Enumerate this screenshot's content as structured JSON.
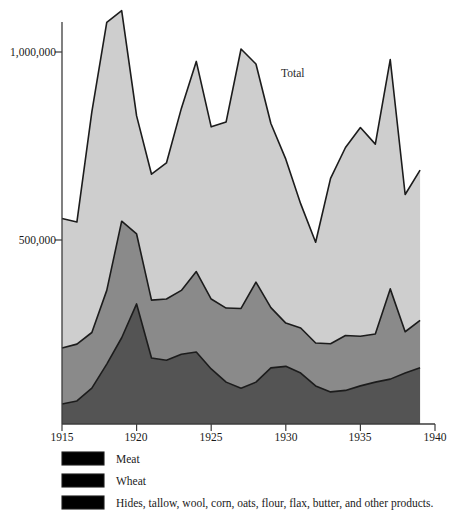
{
  "chart_data": {
    "type": "area",
    "title": "",
    "subtitle": "",
    "xlabel": "",
    "ylabel": "",
    "stacked": true,
    "grid": false,
    "legend_position": "bottom-left",
    "annotations": [
      {
        "text": "Total",
        "x": 1927.8,
        "y": 905000
      }
    ],
    "xlim": [
      1915,
      1940
    ],
    "ylim": [
      0,
      1150000
    ],
    "x_ticks": [
      1915,
      1920,
      1925,
      1930,
      1935,
      1940
    ],
    "x_tick_labels": [
      "1915",
      "1920",
      "1925",
      "1930",
      "1935",
      "1940"
    ],
    "y_ticks": [
      500000,
      1000000
    ],
    "y_tick_labels": [
      "500,000",
      "1,000,000"
    ],
    "x": [
      1915,
      1916,
      1917,
      1918,
      1919,
      1920,
      1921,
      1922,
      1923,
      1924,
      1925,
      1926,
      1927,
      1928,
      1929,
      1930,
      1931,
      1932,
      1933,
      1934,
      1935,
      1936,
      1937,
      1938,
      1939
    ],
    "series": [
      {
        "name": "Meat",
        "color": "#545454",
        "values": [
          64000,
          72000,
          106000,
          170000,
          240000,
          330000,
          186000,
          180000,
          196000,
          202000,
          157000,
          122000,
          106000,
          122000,
          160000,
          164000,
          146000,
          112000,
          96000,
          100000,
          112000,
          122000,
          130000,
          146000,
          160000
        ]
      },
      {
        "name": "Wheat",
        "color": "#8a8a8a",
        "values": [
          149000,
          151000,
          148000,
          196000,
          310000,
          186000,
          154000,
          163000,
          170000,
          214000,
          186000,
          197000,
          212000,
          266000,
          160000,
          115000,
          120000,
          114000,
          128000,
          146000,
          132000,
          128000,
          240000,
          110000,
          126000
        ]
      },
      {
        "name": "Hides, tallow, wool, corn, oats, flour, flax, butter, and other products.",
        "color": "#cecece",
        "values": [
          344000,
          325000,
          587000,
          713000,
          560000,
          314000,
          335000,
          362000,
          484000,
          559000,
          458000,
          495000,
          690000,
          580000,
          490000,
          436000,
          330000,
          268000,
          440000,
          500000,
          555000,
          505000,
          610000,
          365000,
          400000
        ]
      }
    ],
    "totals": [
      557000,
      548000,
      841000,
      1079000,
      1110000,
      830000,
      675000,
      705000,
      850000,
      975000,
      801000,
      814000,
      1008000,
      968000,
      810000,
      715000,
      596000,
      494000,
      664000,
      746000,
      799000,
      755000,
      980000,
      621000,
      686000
    ]
  },
  "legend": {
    "items": [
      {
        "label": "Meat",
        "color": "#545454"
      },
      {
        "label": "Wheat",
        "color": "#8a8a8a"
      },
      {
        "label": "Hides, tallow, wool, corn, oats, flour, flax, butter, and other products.",
        "color": "#cecece"
      }
    ]
  },
  "axis": {
    "y_labels": [
      "1,000,000",
      "500,000"
    ],
    "x_labels": [
      "1915",
      "1920",
      "1925",
      "1930",
      "1935",
      "1940"
    ]
  },
  "annotation": {
    "total": "Total"
  }
}
